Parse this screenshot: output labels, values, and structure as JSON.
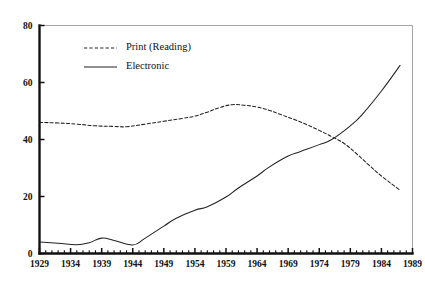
{
  "chart_data": {
    "type": "line",
    "title": "",
    "subtitle": "",
    "xlabel": "",
    "ylabel": "",
    "xlim": [
      1929,
      1989
    ],
    "ylim": [
      0,
      80
    ],
    "grid": false,
    "legend_position": "top-left-inside",
    "y_ticks": [
      0,
      20,
      40,
      60,
      80
    ],
    "y_tick_labels": [
      "0",
      "20",
      "40",
      "60",
      "80"
    ],
    "x_ticks": [
      1929,
      1934,
      1939,
      1944,
      1949,
      1954,
      1959,
      1964,
      1969,
      1974,
      1979,
      1984,
      1989
    ],
    "x_tick_labels": [
      "1929",
      "1934",
      "1939",
      "1944",
      "1949",
      "1954",
      "1959",
      "1964",
      "1969",
      "1974",
      "1979",
      "1984",
      "1989"
    ],
    "x_minor_tick_step": 1,
    "series": [
      {
        "name": "Print (Reading)",
        "style": "dashed",
        "color": "#222222",
        "x": [
          1929,
          1932,
          1935,
          1938,
          1941,
          1943,
          1946,
          1949,
          1952,
          1954,
          1956,
          1958,
          1960,
          1962,
          1964,
          1966,
          1968,
          1970,
          1972,
          1974,
          1976,
          1978,
          1980,
          1982,
          1984,
          1987
        ],
        "values": [
          46.0,
          45.8,
          45.4,
          44.8,
          44.6,
          44.5,
          45.4,
          46.4,
          47.4,
          48.2,
          49.6,
          51.2,
          52.2,
          52.0,
          51.4,
          50.2,
          48.6,
          47.0,
          45.2,
          43.2,
          41.0,
          38.6,
          35.0,
          31.0,
          27.2,
          22.2
        ]
      },
      {
        "name": "Electronic",
        "style": "solid",
        "color": "#222222",
        "x": [
          1929,
          1932,
          1935,
          1937,
          1939,
          1941,
          1944,
          1946,
          1949,
          1951,
          1954,
          1956,
          1959,
          1961,
          1964,
          1966,
          1969,
          1971,
          1974,
          1976,
          1979,
          1981,
          1984,
          1987
        ],
        "values": [
          4.0,
          3.6,
          3.1,
          3.8,
          5.4,
          4.6,
          3.0,
          5.4,
          9.6,
          12.4,
          15.2,
          16.4,
          19.8,
          23.0,
          27.2,
          30.4,
          34.2,
          35.8,
          38.2,
          40.0,
          44.8,
          49.0,
          57.0,
          66.0
        ]
      }
    ],
    "legend": [
      {
        "label": "Print (Reading)",
        "style": "dashed"
      },
      {
        "label": "Electronic",
        "style": "solid"
      }
    ]
  }
}
